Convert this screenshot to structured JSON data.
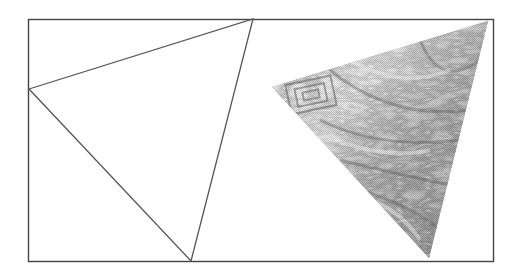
{
  "figure": {
    "frame": {
      "x": 28,
      "y": 19,
      "width": 465,
      "height": 243,
      "stroke": "#444444"
    },
    "wireframe_triangle": {
      "vertices": [
        [
          29,
          89
        ],
        [
          253,
          19
        ],
        [
          191,
          261
        ]
      ],
      "stroke": "#555555"
    },
    "textured_triangle": {
      "vertices": [
        [
          272,
          87
        ],
        [
          488,
          21
        ],
        [
          429,
          258
        ]
      ],
      "texture": "grayscale marbled wavy pattern",
      "colors": {
        "light": "#eeeeee",
        "mid": "#aaaaaa",
        "dark": "#555555"
      }
    }
  }
}
